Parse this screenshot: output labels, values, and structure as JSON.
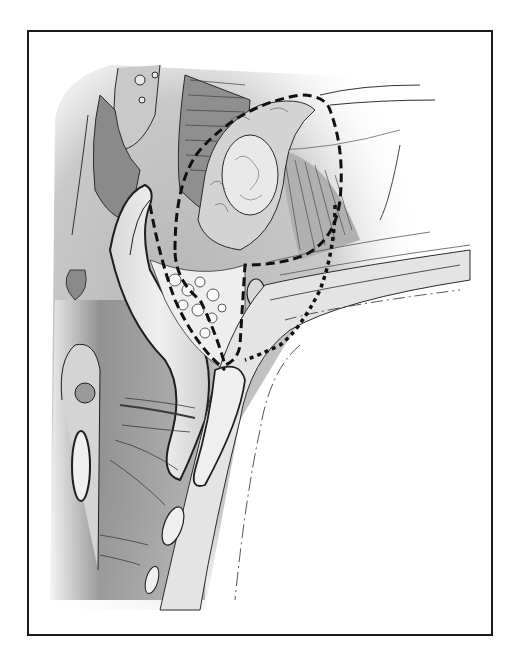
{
  "figure": {
    "kind": "anatomical-illustration",
    "colors": {
      "frame": "#1a1a1a",
      "background": "#ffffff",
      "dark_tissue": "#6e6e6e",
      "mid_tissue": "#a8a8a8",
      "light_tissue": "#e6e6e6",
      "outline": "#202020"
    },
    "annotations": {
      "dashed_boundary": "large dashed outline around mass",
      "dotted_boundary": "dotted outline extending downward along canal"
    }
  }
}
